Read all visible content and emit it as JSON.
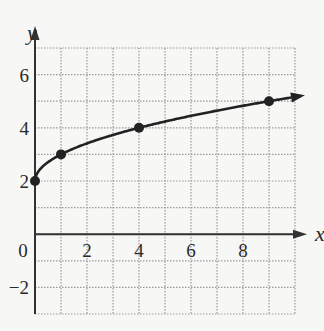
{
  "chart_data": {
    "type": "line",
    "title": "",
    "xlabel": "x",
    "ylabel": "y",
    "xlim": [
      0,
      10
    ],
    "ylim": [
      -3,
      7
    ],
    "grid": true,
    "x_ticks": [
      0,
      2,
      4,
      6,
      8
    ],
    "y_ticks": [
      -2,
      2,
      4,
      6
    ],
    "series": [
      {
        "name": "y = sqrt(x) + 2",
        "points": [
          [
            0,
            2
          ],
          [
            1,
            3
          ],
          [
            4,
            4
          ],
          [
            9,
            5
          ]
        ],
        "arrow_end": true
      }
    ],
    "colors": {
      "curve": "#222222",
      "grid": "#9a9a9a",
      "axis": "#333333"
    }
  },
  "labels": {
    "x_axis": "x",
    "y_axis": "y",
    "x_tick_labels": [
      "0",
      "2",
      "4",
      "6",
      "8"
    ],
    "y_tick_labels": [
      "6",
      "4",
      "2",
      "−2"
    ]
  }
}
